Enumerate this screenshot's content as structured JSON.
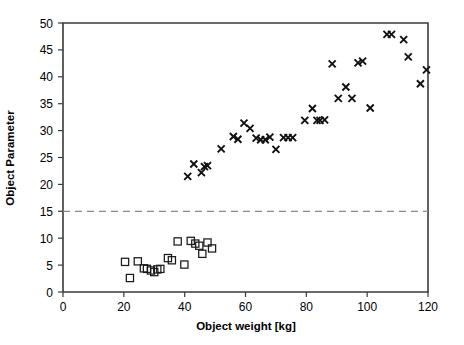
{
  "chart_data": {
    "type": "scatter",
    "title": "",
    "xlabel": "Object weight [kg]",
    "ylabel": "Object Parameter",
    "xlim": [
      0,
      120
    ],
    "ylim": [
      0,
      50
    ],
    "xticks": [
      0,
      20,
      40,
      60,
      80,
      100,
      120
    ],
    "yticks": [
      0,
      5,
      10,
      15,
      20,
      25,
      30,
      35,
      40,
      45,
      50
    ],
    "xtick_labels": [
      "0",
      "20",
      "40",
      "60",
      "80",
      "100",
      "120"
    ],
    "ytick_labels": [
      "0",
      "5",
      "10",
      "15",
      "20",
      "25",
      "30",
      "35",
      "40",
      "45",
      "50"
    ],
    "grid": false,
    "legend": false,
    "legend_position": "none",
    "annotations": [
      {
        "name": "threshold-line",
        "type": "horizontal-dashed-line",
        "y": 15,
        "color": "#8a8a8a",
        "style": "dashed"
      }
    ],
    "series": [
      {
        "name": "Group A (squares)",
        "marker": "square",
        "color": "#1a1a1a",
        "fill": "none",
        "points": [
          [
            20.4,
            5.6
          ],
          [
            22.0,
            2.6
          ],
          [
            24.6,
            5.7
          ],
          [
            26.6,
            4.4
          ],
          [
            27.6,
            4.3
          ],
          [
            28.9,
            4.0
          ],
          [
            30.0,
            3.7
          ],
          [
            31.0,
            4.2
          ],
          [
            32.0,
            4.3
          ],
          [
            34.5,
            6.3
          ],
          [
            35.8,
            5.9
          ],
          [
            37.7,
            9.4
          ],
          [
            39.9,
            5.1
          ],
          [
            42.0,
            9.5
          ],
          [
            43.5,
            9.0
          ],
          [
            44.8,
            8.6
          ],
          [
            45.8,
            7.1
          ],
          [
            47.5,
            9.2
          ],
          [
            49.0,
            8.1
          ]
        ]
      },
      {
        "name": "Group B (crosses)",
        "marker": "x",
        "color": "#111111",
        "points": [
          [
            41.0,
            21.5
          ],
          [
            43.0,
            23.8
          ],
          [
            45.5,
            22.2
          ],
          [
            46.5,
            23.3
          ],
          [
            47.5,
            23.5
          ],
          [
            52.0,
            26.6
          ],
          [
            56.0,
            28.9
          ],
          [
            57.5,
            28.4
          ],
          [
            59.5,
            31.4
          ],
          [
            61.5,
            30.4
          ],
          [
            63.5,
            28.6
          ],
          [
            65.0,
            28.3
          ],
          [
            66.5,
            28.3
          ],
          [
            68.0,
            28.8
          ],
          [
            70.0,
            26.5
          ],
          [
            72.5,
            28.7
          ],
          [
            74.0,
            28.7
          ],
          [
            75.5,
            28.7
          ],
          [
            79.5,
            31.9
          ],
          [
            82.0,
            34.1
          ],
          [
            83.5,
            31.9
          ],
          [
            84.5,
            31.9
          ],
          [
            86.0,
            32.0
          ],
          [
            88.5,
            42.4
          ],
          [
            90.5,
            36.0
          ],
          [
            93.0,
            38.1
          ],
          [
            95.0,
            36.0
          ],
          [
            97.0,
            42.6
          ],
          [
            98.5,
            42.9
          ],
          [
            101.0,
            34.2
          ],
          [
            106.5,
            47.9
          ],
          [
            108.0,
            47.9
          ],
          [
            112.0,
            46.9
          ],
          [
            113.5,
            43.7
          ],
          [
            117.5,
            38.7
          ],
          [
            119.5,
            41.3
          ]
        ]
      }
    ]
  }
}
